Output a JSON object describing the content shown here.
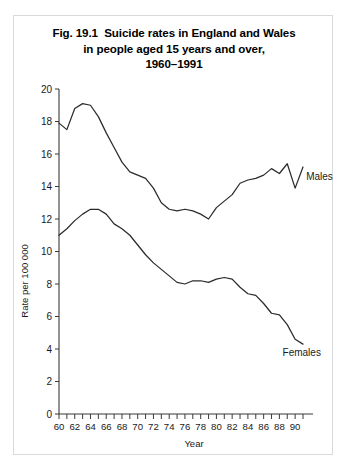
{
  "figure": {
    "title_lines": [
      "Fig. 19.1  Suicide rates in England and Wales",
      "in people aged 15 years and over,",
      "1960–1991"
    ]
  },
  "chart_data": {
    "type": "line",
    "xlabel": "Year",
    "ylabel": "Rate per 100 000",
    "xlim": [
      1960,
      1991
    ],
    "ylim": [
      0,
      20
    ],
    "ytick_values": [
      0,
      2,
      4,
      6,
      8,
      10,
      12,
      14,
      16,
      18,
      20
    ],
    "ytick_labels": [
      "0",
      "2",
      "4",
      "6",
      "8",
      "10",
      "12",
      "14",
      "16",
      "18",
      "20"
    ],
    "xtick_values": [
      1960,
      1962,
      1964,
      1966,
      1968,
      1970,
      1972,
      1974,
      1976,
      1978,
      1980,
      1982,
      1984,
      1986,
      1988,
      1990
    ],
    "xtick_labels": [
      "60",
      "62",
      "64",
      "66",
      "68",
      "70",
      "72",
      "74",
      "76",
      "78",
      "80",
      "82",
      "84",
      "86",
      "88",
      "90"
    ],
    "xtick_minor_values": [
      1961,
      1963,
      1965,
      1967,
      1969,
      1971,
      1973,
      1975,
      1977,
      1979,
      1981,
      1983,
      1985,
      1987,
      1989,
      1991
    ],
    "grid": false,
    "legend_position": "inline-right",
    "x": [
      1960,
      1961,
      1962,
      1963,
      1964,
      1965,
      1966,
      1967,
      1968,
      1969,
      1970,
      1971,
      1972,
      1973,
      1974,
      1975,
      1976,
      1977,
      1978,
      1979,
      1980,
      1981,
      1982,
      1983,
      1984,
      1985,
      1986,
      1987,
      1988,
      1989,
      1990,
      1991
    ],
    "series": [
      {
        "name": "Males",
        "label": "Males",
        "color": "#2b2b2b",
        "values": [
          17.9,
          17.5,
          18.8,
          19.1,
          19.0,
          18.3,
          17.3,
          16.4,
          15.5,
          14.9,
          14.7,
          14.5,
          13.9,
          13.0,
          12.6,
          12.5,
          12.6,
          12.5,
          12.3,
          12.0,
          12.7,
          13.1,
          13.5,
          14.2,
          14.4,
          14.5,
          14.7,
          15.1,
          14.8,
          15.4,
          13.9,
          15.2
        ]
      },
      {
        "name": "Females",
        "label": "Females",
        "color": "#2b2b2b",
        "values": [
          11.0,
          11.4,
          11.9,
          12.3,
          12.6,
          12.6,
          12.3,
          11.7,
          11.4,
          11.0,
          10.4,
          9.8,
          9.3,
          8.9,
          8.5,
          8.1,
          8.0,
          8.2,
          8.2,
          8.1,
          8.3,
          8.4,
          8.3,
          7.8,
          7.4,
          7.3,
          6.8,
          6.2,
          6.1,
          5.5,
          4.6,
          4.3
        ]
      }
    ],
    "annotations": [
      {
        "text": "Males",
        "x": 1991.4,
        "y": 14.4
      },
      {
        "text": "Females",
        "x": 1988.4,
        "y": 3.6
      }
    ]
  }
}
